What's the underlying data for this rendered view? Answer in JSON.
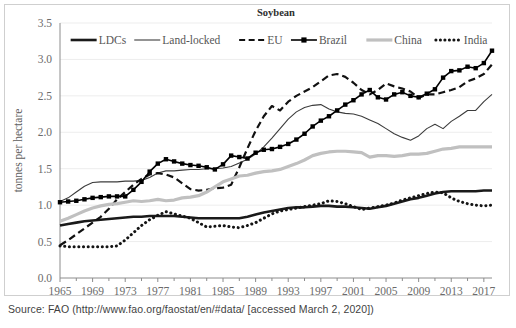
{
  "figure": {
    "source_note": "Source: FAO (http://www.fao.org/faostat/en/#data/ [accessed March 2, 2020])"
  },
  "chart_data": {
    "type": "line",
    "title": "Soybean",
    "xlabel": "",
    "ylabel": "tonnes per hectare",
    "ylim": [
      0.0,
      3.5
    ],
    "ytick_labels": [
      "0.0",
      "0.5",
      "1.0",
      "1.5",
      "2.0",
      "2.5",
      "3.0",
      "3.5"
    ],
    "yticks": [
      0.0,
      0.5,
      1.0,
      1.5,
      2.0,
      2.5,
      3.0,
      3.5
    ],
    "xlim": [
      1965,
      2018
    ],
    "xtick_labels": [
      "1965",
      "1969",
      "1973",
      "1977",
      "1981",
      "1985",
      "1989",
      "1993",
      "1997",
      "2001",
      "2005",
      "2009",
      "2013",
      "2017"
    ],
    "xticks": [
      1965,
      1969,
      1973,
      1977,
      1981,
      1985,
      1989,
      1993,
      1997,
      2001,
      2005,
      2009,
      2013,
      2017
    ],
    "grid": true,
    "legend_position": "top-inside",
    "x": [
      1965,
      1966,
      1967,
      1968,
      1969,
      1970,
      1971,
      1972,
      1973,
      1974,
      1975,
      1976,
      1977,
      1978,
      1979,
      1980,
      1981,
      1982,
      1983,
      1984,
      1985,
      1986,
      1987,
      1988,
      1989,
      1990,
      1991,
      1992,
      1993,
      1994,
      1995,
      1996,
      1997,
      1998,
      1999,
      2000,
      2001,
      2002,
      2003,
      2004,
      2005,
      2006,
      2007,
      2008,
      2009,
      2010,
      2011,
      2012,
      2013,
      2014,
      2015,
      2016,
      2017,
      2018
    ],
    "series": [
      {
        "name": "LDCs",
        "style": "solid-thick",
        "color": "#1a1a1a",
        "values": [
          0.72,
          0.74,
          0.76,
          0.78,
          0.79,
          0.8,
          0.81,
          0.82,
          0.83,
          0.84,
          0.84,
          0.85,
          0.85,
          0.85,
          0.85,
          0.84,
          0.83,
          0.82,
          0.82,
          0.82,
          0.82,
          0.82,
          0.82,
          0.84,
          0.87,
          0.9,
          0.92,
          0.94,
          0.96,
          0.97,
          0.97,
          0.98,
          0.99,
          0.99,
          0.98,
          0.98,
          0.97,
          0.96,
          0.95,
          0.97,
          0.99,
          1.02,
          1.05,
          1.08,
          1.1,
          1.13,
          1.16,
          1.18,
          1.19,
          1.19,
          1.19,
          1.19,
          1.2,
          1.2
        ]
      },
      {
        "name": "Land-locked",
        "style": "solid-thin",
        "color": "#3c3c3c",
        "values": [
          1.05,
          1.1,
          1.18,
          1.26,
          1.31,
          1.32,
          1.32,
          1.32,
          1.33,
          1.33,
          1.34,
          1.38,
          1.44,
          1.47,
          1.47,
          1.48,
          1.49,
          1.49,
          1.5,
          1.5,
          1.51,
          1.53,
          1.58,
          1.63,
          1.7,
          1.8,
          1.92,
          2.05,
          2.18,
          2.28,
          2.34,
          2.37,
          2.38,
          2.32,
          2.28,
          2.26,
          2.25,
          2.22,
          2.17,
          2.12,
          2.05,
          1.98,
          1.93,
          1.89,
          1.95,
          2.05,
          2.11,
          2.05,
          2.15,
          2.22,
          2.3,
          2.3,
          2.42,
          2.52
        ]
      },
      {
        "name": "EU",
        "style": "dashed",
        "color": "#111111",
        "values": [
          0.45,
          0.52,
          0.6,
          0.68,
          0.76,
          0.84,
          0.95,
          1.08,
          1.18,
          1.28,
          1.36,
          1.42,
          1.44,
          1.42,
          1.38,
          1.3,
          1.22,
          1.2,
          1.21,
          1.23,
          1.24,
          1.28,
          1.52,
          1.78,
          2.02,
          2.22,
          2.36,
          2.3,
          2.42,
          2.5,
          2.56,
          2.62,
          2.7,
          2.78,
          2.8,
          2.76,
          2.68,
          2.58,
          2.52,
          2.58,
          2.67,
          2.63,
          2.6,
          2.56,
          2.47,
          2.52,
          2.52,
          2.55,
          2.58,
          2.62,
          2.7,
          2.74,
          2.8,
          2.93
        ]
      },
      {
        "name": "Brazil",
        "style": "marker-line",
        "color": "#000000",
        "values": [
          1.04,
          1.05,
          1.06,
          1.08,
          1.1,
          1.11,
          1.12,
          1.12,
          1.12,
          1.21,
          1.32,
          1.46,
          1.57,
          1.63,
          1.6,
          1.57,
          1.55,
          1.54,
          1.52,
          1.49,
          1.56,
          1.68,
          1.66,
          1.64,
          1.72,
          1.76,
          1.77,
          1.8,
          1.84,
          1.9,
          1.98,
          2.08,
          2.16,
          2.22,
          2.3,
          2.38,
          2.44,
          2.52,
          2.58,
          2.48,
          2.45,
          2.52,
          2.55,
          2.5,
          2.48,
          2.53,
          2.59,
          2.75,
          2.84,
          2.85,
          2.9,
          2.88,
          2.95,
          3.12
        ]
      },
      {
        "name": "China",
        "style": "solid-grey",
        "color": "#c0c0c0",
        "values": [
          0.78,
          0.82,
          0.87,
          0.92,
          0.96,
          0.99,
          1.01,
          1.02,
          1.04,
          1.06,
          1.05,
          1.06,
          1.08,
          1.06,
          1.07,
          1.1,
          1.11,
          1.13,
          1.18,
          1.25,
          1.32,
          1.36,
          1.4,
          1.41,
          1.44,
          1.46,
          1.47,
          1.49,
          1.53,
          1.57,
          1.62,
          1.68,
          1.71,
          1.73,
          1.74,
          1.74,
          1.73,
          1.72,
          1.66,
          1.68,
          1.68,
          1.67,
          1.68,
          1.7,
          1.7,
          1.71,
          1.74,
          1.77,
          1.78,
          1.8,
          1.8,
          1.8,
          1.8,
          1.8
        ]
      },
      {
        "name": "India",
        "style": "dotted",
        "color": "#141414",
        "values": [
          0.44,
          0.43,
          0.43,
          0.43,
          0.43,
          0.43,
          0.43,
          0.44,
          0.52,
          0.62,
          0.72,
          0.8,
          0.86,
          0.91,
          0.88,
          0.85,
          0.82,
          0.76,
          0.7,
          0.71,
          0.72,
          0.7,
          0.69,
          0.72,
          0.76,
          0.82,
          0.88,
          0.92,
          0.94,
          0.96,
          0.98,
          1.0,
          1.02,
          1.06,
          1.05,
          1.02,
          0.98,
          0.94,
          0.96,
          0.98,
          1.0,
          1.03,
          1.07,
          1.1,
          1.13,
          1.16,
          1.18,
          1.17,
          1.1,
          1.05,
          1.02,
          1.0,
          0.99,
          1.0
        ]
      }
    ]
  }
}
